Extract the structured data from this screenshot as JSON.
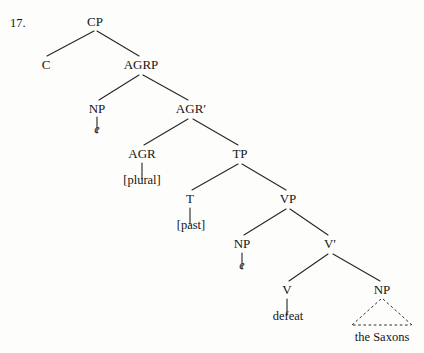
{
  "figure": {
    "item_number": "17.",
    "type": "syntax-tree",
    "background_color": "#fdfdfc",
    "line_color": "#262626",
    "text_color": "#151515"
  },
  "nodes": [
    {
      "id": "cp",
      "label": "CP",
      "x": 95,
      "y": 15,
      "style": "node"
    },
    {
      "id": "c",
      "label": "C",
      "x": 46,
      "y": 58,
      "style": "node"
    },
    {
      "id": "agrp",
      "label": "AGRP",
      "x": 141,
      "y": 58,
      "style": "node"
    },
    {
      "id": "np-subj",
      "label": "NP",
      "x": 97,
      "y": 102,
      "style": "node"
    },
    {
      "id": "agrbar",
      "label": "AGR′",
      "x": 191,
      "y": 102,
      "style": "node"
    },
    {
      "id": "e-subj",
      "label": "e",
      "x": 97,
      "y": 123,
      "style": "node italic"
    },
    {
      "id": "agr",
      "label": "AGR",
      "x": 142,
      "y": 147,
      "style": "node"
    },
    {
      "id": "tp",
      "label": "TP",
      "x": 240,
      "y": 147,
      "style": "node"
    },
    {
      "id": "plural",
      "label": "[plural]",
      "x": 142,
      "y": 174,
      "style": "node terminal"
    },
    {
      "id": "t",
      "label": "T",
      "x": 190,
      "y": 192,
      "style": "node"
    },
    {
      "id": "vp",
      "label": "VP",
      "x": 288,
      "y": 192,
      "style": "node"
    },
    {
      "id": "past",
      "label": "[past]",
      "x": 191,
      "y": 219,
      "style": "node terminal"
    },
    {
      "id": "np-obj-tr",
      "label": "NP",
      "x": 242,
      "y": 237,
      "style": "node"
    },
    {
      "id": "vbar",
      "label": "V′",
      "x": 330,
      "y": 237,
      "style": "node"
    },
    {
      "id": "e-vp",
      "label": "e",
      "x": 242,
      "y": 259,
      "style": "node italic"
    },
    {
      "id": "v",
      "label": "V",
      "x": 287,
      "y": 283,
      "style": "node"
    },
    {
      "id": "np-obj",
      "label": "NP",
      "x": 382,
      "y": 283,
      "style": "node"
    },
    {
      "id": "defeat",
      "label": "defeat",
      "x": 288,
      "y": 310,
      "style": "node terminal"
    },
    {
      "id": "saxons",
      "label": "the Saxons",
      "x": 382,
      "y": 331,
      "style": "node terminal"
    }
  ],
  "branches": [
    {
      "from": "cp",
      "to": "c",
      "x1": 94,
      "y1": 31,
      "x2": 47,
      "y2": 56,
      "kind": "solid"
    },
    {
      "from": "cp",
      "to": "agrp",
      "x1": 97,
      "y1": 31,
      "x2": 139,
      "y2": 56,
      "kind": "solid"
    },
    {
      "from": "agrp",
      "to": "np-subj",
      "x1": 139,
      "y1": 75,
      "x2": 99,
      "y2": 100,
      "kind": "solid"
    },
    {
      "from": "agrp",
      "to": "agrbar",
      "x1": 143,
      "y1": 75,
      "x2": 188,
      "y2": 100,
      "kind": "solid"
    },
    {
      "from": "np-subj",
      "to": "e-subj",
      "x1": 97,
      "y1": 117,
      "x2": 97,
      "y2": 134,
      "kind": "solid"
    },
    {
      "from": "agrbar",
      "to": "agr",
      "x1": 188,
      "y1": 119,
      "x2": 144,
      "y2": 145,
      "kind": "solid"
    },
    {
      "from": "agrbar",
      "to": "tp",
      "x1": 193,
      "y1": 119,
      "x2": 238,
      "y2": 145,
      "kind": "solid"
    },
    {
      "from": "agr",
      "to": "plural",
      "x1": 142,
      "y1": 163,
      "x2": 142,
      "y2": 180,
      "kind": "solid"
    },
    {
      "from": "tp",
      "to": "t",
      "x1": 238,
      "y1": 164,
      "x2": 192,
      "y2": 190,
      "kind": "solid"
    },
    {
      "from": "tp",
      "to": "vp",
      "x1": 242,
      "y1": 164,
      "x2": 286,
      "y2": 190,
      "kind": "solid"
    },
    {
      "from": "t",
      "to": "past",
      "x1": 190,
      "y1": 208,
      "x2": 190,
      "y2": 225,
      "kind": "solid"
    },
    {
      "from": "vp",
      "to": "np-obj-tr",
      "x1": 286,
      "y1": 209,
      "x2": 244,
      "y2": 235,
      "kind": "solid"
    },
    {
      "from": "vp",
      "to": "vbar",
      "x1": 290,
      "y1": 209,
      "x2": 328,
      "y2": 235,
      "kind": "solid"
    },
    {
      "from": "np-obj-tr",
      "to": "e-vp",
      "x1": 242,
      "y1": 253,
      "x2": 242,
      "y2": 270,
      "kind": "solid"
    },
    {
      "from": "vbar",
      "to": "v",
      "x1": 328,
      "y1": 254,
      "x2": 289,
      "y2": 281,
      "kind": "solid"
    },
    {
      "from": "vbar",
      "to": "np-obj",
      "x1": 333,
      "y1": 254,
      "x2": 380,
      "y2": 281,
      "kind": "solid"
    },
    {
      "from": "v",
      "to": "defeat",
      "x1": 287,
      "y1": 299,
      "x2": 287,
      "y2": 316,
      "kind": "solid"
    }
  ],
  "triangle": {
    "label": "the Saxons",
    "apex_x": 382,
    "apex_y": 299,
    "left_x": 352,
    "right_x": 412,
    "base_y": 325,
    "kind": "dashed"
  }
}
